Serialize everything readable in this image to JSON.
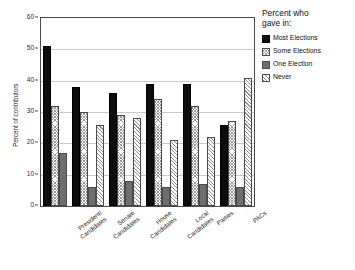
{
  "chart_data": {
    "type": "bar",
    "title": "",
    "subtitle": "",
    "xlabel": "",
    "ylabel": "Percent of contributors",
    "ylim": [
      0,
      60
    ],
    "yticks": [
      0,
      10,
      20,
      30,
      40,
      50,
      60
    ],
    "ytick_labels": [
      "0",
      "10",
      "20",
      "30",
      "40",
      "50",
      "60"
    ],
    "grid": true,
    "grid_axis": "y",
    "legend_position": "right",
    "legend_title": "Percent who gave in:",
    "categories": [
      "Presidentl Candidates",
      "Senate Candidates",
      "House Candidates",
      "Local Candidates",
      "Parties",
      "PACs"
    ],
    "category_lines": [
      [
        "Presidentl",
        "Candidates"
      ],
      [
        "Senate",
        "Candidates"
      ],
      [
        "House",
        "Candidates"
      ],
      [
        "Local",
        "Candidates"
      ],
      [
        "Parties"
      ],
      [
        "PACs"
      ]
    ],
    "series": [
      {
        "name": "Most Elections",
        "color": "#0d0d0d",
        "pattern": "solid",
        "values": [
          51,
          38,
          36,
          39,
          39,
          26
        ]
      },
      {
        "name": "Some Elections",
        "color": "#9a9a9a",
        "pattern": "crosshatch",
        "values": [
          32,
          30,
          29,
          34,
          32,
          27
        ]
      },
      {
        "name": "One Election",
        "color": "#6e6e6e",
        "pattern": "solid-gray",
        "values": [
          17,
          6,
          8,
          6,
          7,
          6
        ]
      },
      {
        "name": "Never",
        "color": "#8e8e8e",
        "pattern": "diagonal",
        "values": [
          null,
          26,
          28,
          21,
          22,
          41
        ]
      }
    ]
  },
  "legend": {
    "title_line_1": "Percent who",
    "title_line_2": "gave in:",
    "items": [
      {
        "label": "Most Elections"
      },
      {
        "label": "Some Elections"
      },
      {
        "label": "One Election"
      },
      {
        "label": "Never"
      }
    ]
  },
  "axes": {
    "y_title": "Percent of contributors"
  }
}
